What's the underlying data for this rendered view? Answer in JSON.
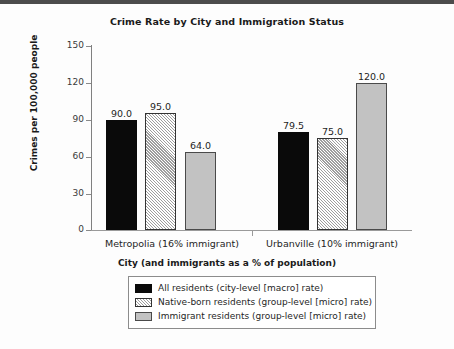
{
  "chart_data": {
    "type": "bar",
    "title": "Crime Rate by City and Immigration Status",
    "xlabel": "City (and immigrants as a % of population)",
    "ylabel": "Crimes per 100,000 people",
    "categories": [
      "Metropolia (16% immigrant)",
      "Urbanville (10% immigrant)"
    ],
    "series": [
      {
        "name": "All residents (city-level [macro] rate)",
        "values": [
          90.0,
          79.5
        ],
        "labels": [
          "90.0",
          "79.5"
        ],
        "style": "solid",
        "color": "#0a0a0a"
      },
      {
        "name": "Native-born residents (group-level [micro] rate)",
        "values": [
          95.0,
          75.0
        ],
        "labels": [
          "95.0",
          "75.0"
        ],
        "style": "hatch",
        "color": "#ffffff"
      },
      {
        "name": "Immigrant residents (group-level [micro] rate)",
        "values": [
          64.0,
          120.0
        ],
        "labels": [
          "64.0",
          "120.0"
        ],
        "style": "gray",
        "color": "#c2c2c2"
      }
    ],
    "ylim": [
      0,
      150
    ],
    "yticks": [
      0,
      30,
      60,
      90,
      120,
      150
    ],
    "ytick_labels": [
      "0",
      "30",
      "60",
      "90",
      "120",
      "150"
    ],
    "grid": false,
    "legend_position": "below-axes"
  }
}
